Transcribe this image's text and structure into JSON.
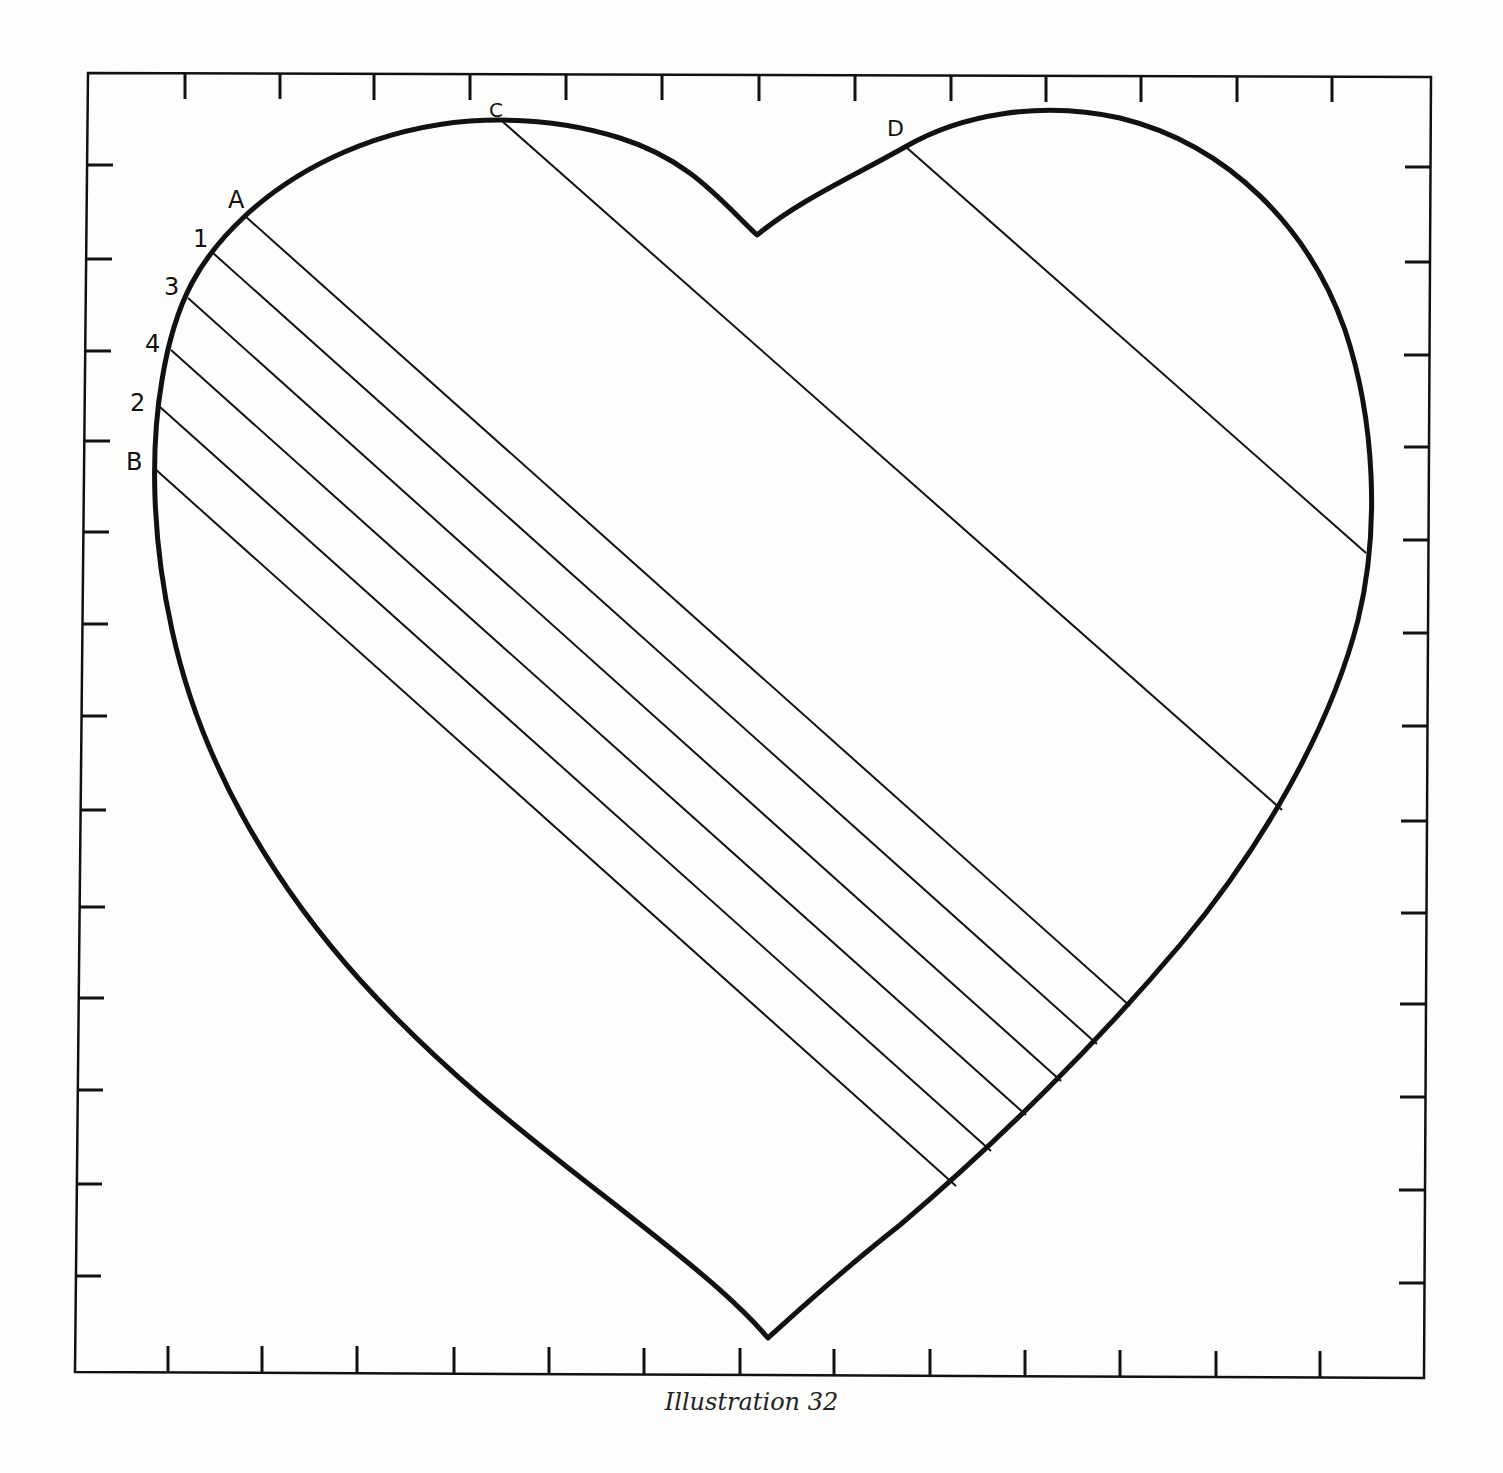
{
  "figure": {
    "caption": "Illustration 32",
    "labels": {
      "A": "A",
      "B": "B",
      "C": "C",
      "D": "D",
      "n1": "1",
      "n2": "2",
      "n3": "3",
      "n4": "4"
    },
    "colors": {
      "ink": "#111111",
      "paper": "#fdfdfc"
    }
  }
}
